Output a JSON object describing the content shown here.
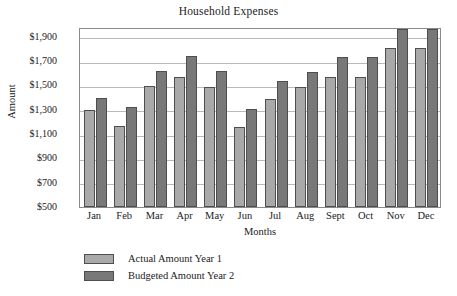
{
  "chart_data": {
    "type": "bar",
    "title": "Household Expenses",
    "xlabel": "Months",
    "ylabel": "Amount",
    "categories": [
      "Jan",
      "Feb",
      "Mar",
      "Apr",
      "May",
      "Jun",
      "Jul",
      "Aug",
      "Sept",
      "Oct",
      "Nov",
      "Dec"
    ],
    "series": [
      {
        "name": "Actual Amount Year 1",
        "color": "#a9a9a9",
        "values": [
          1300,
          1170,
          1495,
          1570,
          1490,
          1160,
          1385,
          1485,
          1565,
          1565,
          1805,
          1805
        ]
      },
      {
        "name": "Budgeted Amount Year 2",
        "color": "#787878",
        "values": [
          1400,
          1320,
          1620,
          1740,
          1615,
          1310,
          1540,
          1610,
          1735,
          1735,
          1960,
          1960
        ]
      }
    ],
    "ylim": [
      500,
      1980
    ],
    "yticks": [
      500,
      700,
      900,
      1100,
      1300,
      1500,
      1700,
      1900
    ],
    "ytick_labels": [
      "$500",
      "$700",
      "$900",
      "$1,100",
      "$1,300",
      "$1,500",
      "$1,700",
      "$1,900"
    ],
    "grid": true,
    "legend_position": "below"
  },
  "legend": {
    "entries": [
      {
        "label": "Actual Amount Year 1"
      },
      {
        "label": "Budgeted Amount Year 2"
      }
    ]
  }
}
